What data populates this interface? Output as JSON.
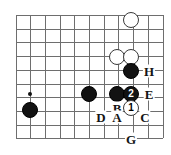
{
  "figure": {
    "kind": "go-board-diagram",
    "width": 171,
    "height": 155,
    "background_color": "#ffffff",
    "grid_color": "#6e6e6e",
    "black_stone_color": "#121212",
    "white_stone_color": "#ffffff",
    "label_color": "#141414"
  },
  "grid": {
    "origin_x": 15.5,
    "origin_y": 15,
    "spacing_x": 14.7,
    "spacing_y": 13.7,
    "columns": 11,
    "rows": 10,
    "show_grid": true
  },
  "star_points": [
    {
      "name": "star-point-left",
      "x": 30,
      "y": 94
    }
  ],
  "stones": [
    {
      "name": "white-stone-top",
      "color": "white",
      "x": 131,
      "y": 20,
      "radius": 8,
      "marker": ""
    },
    {
      "name": "white-stone-upper-left",
      "color": "white",
      "x": 117,
      "y": 57,
      "radius": 8,
      "marker": ""
    },
    {
      "name": "white-stone-upper-right",
      "color": "white",
      "x": 131,
      "y": 57,
      "radius": 8,
      "marker": ""
    },
    {
      "name": "black-stone-h",
      "color": "black",
      "x": 131,
      "y": 71,
      "radius": 8,
      "marker": ""
    },
    {
      "name": "black-stone-far-left",
      "color": "black",
      "x": 30,
      "y": 110,
      "radius": 8,
      "marker": ""
    },
    {
      "name": "black-stone-middle",
      "color": "black",
      "x": 89,
      "y": 94,
      "radius": 8,
      "marker": ""
    },
    {
      "name": "black-stone-b-left",
      "color": "black",
      "x": 117,
      "y": 94,
      "radius": 8,
      "marker": ""
    },
    {
      "name": "black-stone-move-2",
      "color": "black",
      "x": 131,
      "y": 94,
      "radius": 8,
      "marker": "2"
    },
    {
      "name": "white-stone-move-1",
      "color": "white",
      "x": 131,
      "y": 108,
      "radius": 8,
      "marker": "1"
    }
  ],
  "point_labels": [
    {
      "name": "point-label-h",
      "text": "H",
      "x": 149,
      "y": 71
    },
    {
      "name": "point-label-e",
      "text": "E",
      "x": 149,
      "y": 94
    },
    {
      "name": "point-label-b",
      "text": "B",
      "x": 117,
      "y": 108
    },
    {
      "name": "point-label-d",
      "text": "D",
      "x": 101,
      "y": 117
    },
    {
      "name": "point-label-a",
      "text": "A",
      "x": 117,
      "y": 117
    },
    {
      "name": "point-label-c",
      "text": "C",
      "x": 145,
      "y": 117
    },
    {
      "name": "point-label-g",
      "text": "G",
      "x": 131,
      "y": 139
    }
  ]
}
